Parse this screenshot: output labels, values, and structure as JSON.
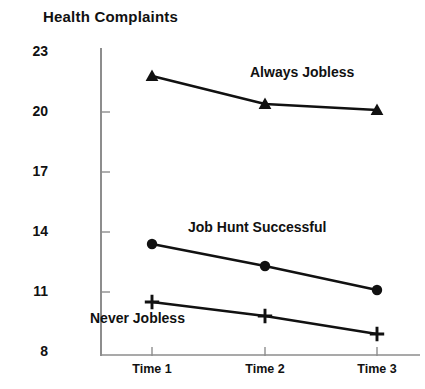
{
  "chart_data": {
    "type": "line",
    "title": "Health Complaints",
    "xlabel": "",
    "ylabel": "Health Complaints",
    "categories": [
      "Time 1",
      "Time 2",
      "Time 3"
    ],
    "ylim": [
      8,
      23
    ],
    "yticks": [
      8,
      11,
      14,
      17,
      20,
      23
    ],
    "grid": false,
    "legend_position": "inline-annotations",
    "series": [
      {
        "name": "Always Jobless",
        "marker": "triangle",
        "values": [
          21.8,
          20.4,
          20.1
        ],
        "label_x": 250,
        "label_y": 64
      },
      {
        "name": "Job Hunt Successful",
        "marker": "circle",
        "values": [
          13.4,
          12.3,
          11.1
        ],
        "label_x": 188,
        "label_y": 219
      },
      {
        "name": "Never Jobless",
        "marker": "plus",
        "values": [
          10.5,
          9.8,
          8.9
        ],
        "label_x": 90,
        "label_y": 310
      }
    ],
    "colors": {
      "line": "#111111",
      "marker": "#111111",
      "axis": "#888888",
      "text": "#111111",
      "background": "#ffffff"
    }
  },
  "axis": {
    "y_tick_labels": [
      "23",
      "20",
      "17",
      "14",
      "11",
      "8"
    ],
    "x_tick_labels": [
      "Time 1",
      "Time 2",
      "Time 3"
    ]
  },
  "title": "Health Complaints"
}
